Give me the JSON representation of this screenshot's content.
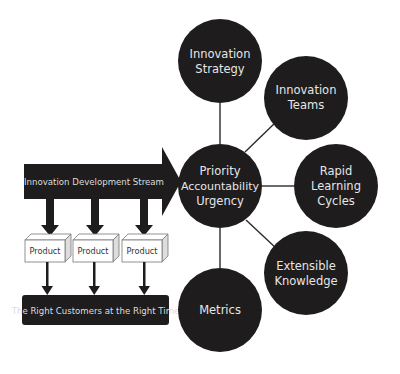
{
  "diagram": {
    "colors": {
      "node_fill": "#1e1c1d",
      "node_text": "#e6e6e6",
      "connector": "#2a2a2a",
      "arrow_fill": "#1e1c1d",
      "product_face": "#ffffff",
      "product_side": "#dddddd",
      "product_border": "#777777",
      "background": "#ffffff"
    },
    "hub": {
      "lines": [
        "Priority",
        "Accountability",
        "Urgency"
      ]
    },
    "satellites": [
      {
        "id": "innovation-strategy",
        "lines": [
          "Innovation",
          "Strategy"
        ]
      },
      {
        "id": "innovation-teams",
        "lines": [
          "Innovation",
          "Teams"
        ]
      },
      {
        "id": "rapid-learning-cycles",
        "lines": [
          "Rapid",
          "Learning",
          "Cycles"
        ]
      },
      {
        "id": "extensible-knowledge",
        "lines": [
          "Extensible",
          "Knowledge"
        ]
      },
      {
        "id": "metrics",
        "lines": [
          "Metrics"
        ]
      }
    ],
    "stream_arrow": {
      "label": "Innovation Development Stream"
    },
    "products": [
      {
        "label": "Product"
      },
      {
        "label": "Product"
      },
      {
        "label": "Product"
      }
    ],
    "outcome": {
      "label": "The Right Customers at the Right Time"
    }
  }
}
